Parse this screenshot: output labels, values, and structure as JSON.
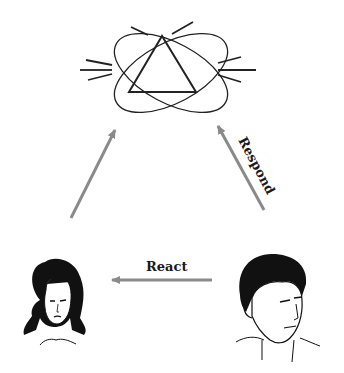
{
  "diagram": {
    "nodes": [
      {
        "id": "symbol",
        "type": "atom-triangle-symbol",
        "description": "triangle inside two crossed ellipses with radiating lines"
      },
      {
        "id": "woman",
        "type": "woman-portrait"
      },
      {
        "id": "man",
        "type": "man-portrait"
      }
    ],
    "edges": [
      {
        "from": "woman",
        "to": "symbol",
        "label": ""
      },
      {
        "from": "man",
        "to": "symbol",
        "label": "Respond"
      },
      {
        "from": "man",
        "to": "woman",
        "label": "React"
      }
    ],
    "labels": {
      "respond": "Respond",
      "react": "React"
    },
    "colors": {
      "arrow": "#8a8a8a",
      "line": "#222222",
      "text": "#1a1a1a",
      "background": "#ffffff"
    }
  }
}
